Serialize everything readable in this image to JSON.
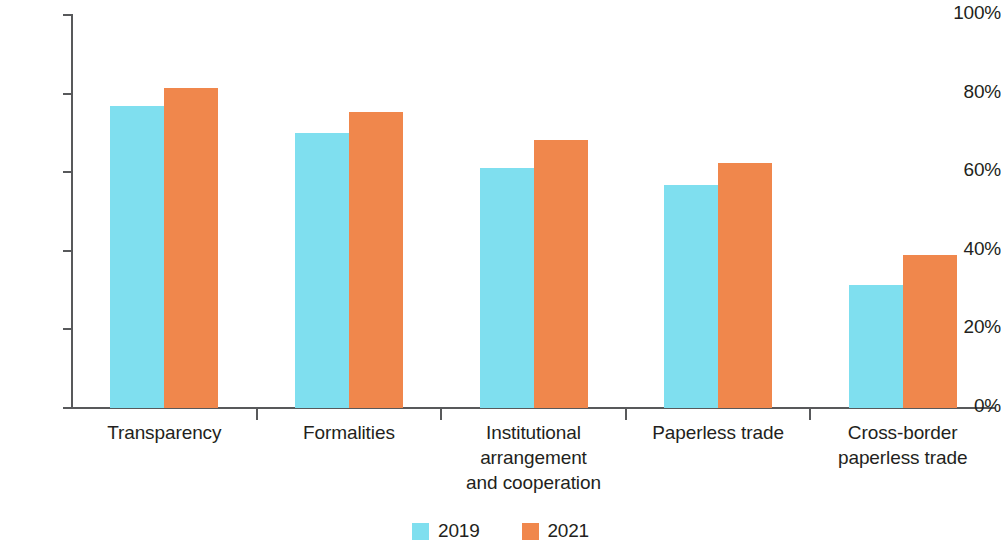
{
  "chart_data": {
    "type": "bar",
    "title": "",
    "subtitle": "",
    "xlabel": "",
    "ylabel": "",
    "ylim": [
      0,
      100
    ],
    "y_ticks": [
      "0%",
      "20%",
      "40%",
      "60%",
      "80%",
      "100%"
    ],
    "y_tick_values": [
      0,
      20,
      40,
      60,
      80,
      100
    ],
    "grid": false,
    "legend_position": "bottom-center",
    "categories": [
      "Transparency",
      "Formalities",
      "Institutional arrangement and cooperation",
      "Paperless trade",
      "Cross-border paperless trade"
    ],
    "category_lines": [
      [
        "Transparency"
      ],
      [
        "Formalities"
      ],
      [
        "Institutional",
        "arrangement",
        "and cooperation"
      ],
      [
        "Paperless trade"
      ],
      [
        "Cross-border",
        "paperless trade"
      ]
    ],
    "series": [
      {
        "name": "2019",
        "color": "#7fdfef",
        "values": [
          76.9,
          70.0,
          61.1,
          56.7,
          31.3
        ]
      },
      {
        "name": "2021",
        "color": "#f0874c",
        "values": [
          81.4,
          75.3,
          68.2,
          62.3,
          38.9
        ]
      }
    ]
  },
  "axis": {
    "line_color": "#58595b"
  },
  "legend": {
    "items": [
      {
        "label": "2019",
        "color": "#7fdfef"
      },
      {
        "label": "2021",
        "color": "#f0874c"
      }
    ]
  }
}
